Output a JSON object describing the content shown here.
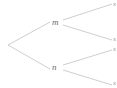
{
  "diagram": {
    "type": "binary-tree",
    "background_color": "#ffffff",
    "edge_color": "#c8c8c8",
    "label_color": "#6b6b6b",
    "leaf_label_color": "#9a9a9a",
    "root": {
      "label": "",
      "x": 8,
      "y": 45
    },
    "internal_nodes": [
      {
        "id": "m",
        "label": "m",
        "x": 56,
        "y": 23
      },
      {
        "id": "n",
        "label": "n",
        "x": 56,
        "y": 68
      }
    ],
    "leaves": [
      {
        "id": "leaf-1",
        "label": "x",
        "x": 112,
        "y": 5,
        "parent": "m"
      },
      {
        "id": "leaf-2",
        "label": "x",
        "x": 112,
        "y": 40,
        "parent": "m"
      },
      {
        "id": "leaf-3",
        "label": "x",
        "x": 112,
        "y": 50,
        "parent": "n"
      },
      {
        "id": "leaf-4",
        "label": "x",
        "x": 112,
        "y": 84,
        "parent": "n"
      }
    ],
    "edges": [
      {
        "id": "edge-root-m",
        "from": "root",
        "to": "m",
        "x1": 8,
        "y1": 45,
        "x2": 50,
        "y2": 22
      },
      {
        "id": "edge-root-n",
        "from": "root",
        "to": "n",
        "x1": 8,
        "y1": 45,
        "x2": 50,
        "y2": 69
      },
      {
        "id": "edge-m-leaf1",
        "from": "m",
        "to": "leaf-1",
        "x1": 63,
        "y1": 20,
        "x2": 110,
        "y2": 4
      },
      {
        "id": "edge-m-leaf2",
        "from": "m",
        "to": "leaf-2",
        "x1": 63,
        "y1": 25,
        "x2": 110,
        "y2": 40
      },
      {
        "id": "edge-n-leaf3",
        "from": "n",
        "to": "leaf-3",
        "x1": 63,
        "y1": 65,
        "x2": 110,
        "y2": 50
      },
      {
        "id": "edge-n-leaf4",
        "from": "n",
        "to": "leaf-4",
        "x1": 63,
        "y1": 70,
        "x2": 110,
        "y2": 85
      }
    ]
  }
}
